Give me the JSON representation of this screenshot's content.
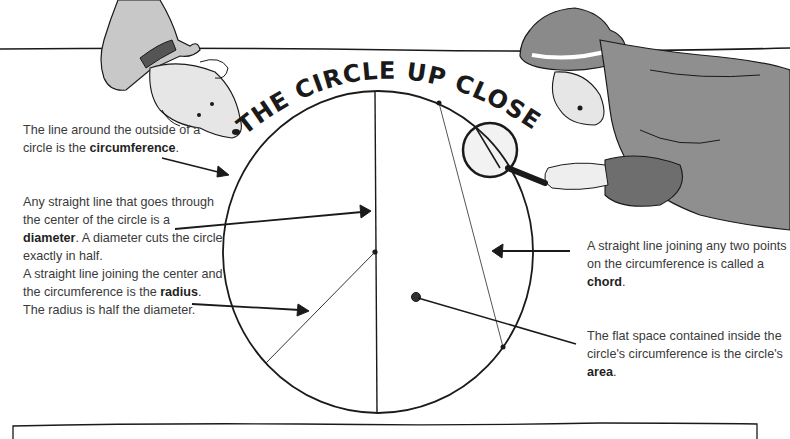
{
  "title": "THE CIRCLE UP CLOSE",
  "labels": {
    "circumference": {
      "before": "The line around the outside of a circle is the ",
      "term": "circumference",
      "after": "."
    },
    "diameter": {
      "before": "Any straight line that goes through the center of the circle is a ",
      "term": "diameter",
      "after": ". A diameter cuts the circle exactly in half."
    },
    "radius": {
      "before": "A straight line joining the center and the circumference is the ",
      "term": "radius",
      "after": ". The radius is half the diameter."
    },
    "chord": {
      "before": "A straight line joining any two points on the circumference is called a ",
      "term": "chord",
      "after": "."
    },
    "area": {
      "before": "The flat space contained inside the circle's circumference is the circle's ",
      "term": "area",
      "after": "."
    }
  },
  "illustrations": {
    "left": "dog-peering-over-edge",
    "right": "detective-with-magnifying-glass"
  },
  "colors": {
    "ink": "#1a1a1a",
    "text": "#3a3a3a",
    "wash": "#9a9a9a"
  }
}
